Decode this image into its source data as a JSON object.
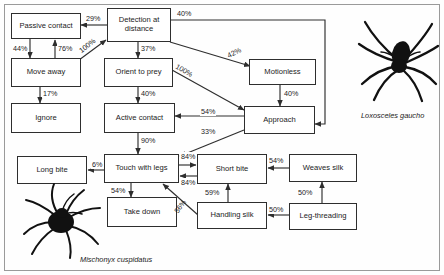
{
  "diagram": {
    "nodes": [
      {
        "id": "passive_contact",
        "label": "Passive contact"
      },
      {
        "id": "detection",
        "label": "Detection at distance"
      },
      {
        "id": "motionless",
        "label": "Motionless"
      },
      {
        "id": "move_away",
        "label": "Move away"
      },
      {
        "id": "orient",
        "label": "Orient to prey"
      },
      {
        "id": "approach",
        "label": "Approach"
      },
      {
        "id": "ignore",
        "label": "Ignore"
      },
      {
        "id": "active_contact",
        "label": "Active contact"
      },
      {
        "id": "long_bite",
        "label": "Long bite"
      },
      {
        "id": "touch_legs",
        "label": "Touch with legs"
      },
      {
        "id": "short_bite",
        "label": "Short bite"
      },
      {
        "id": "weaves_silk",
        "label": "Weaves silk"
      },
      {
        "id": "take_down",
        "label": "Take down"
      },
      {
        "id": "handling_silk",
        "label": "Handling silk"
      },
      {
        "id": "leg_threading",
        "label": "Leg-threading"
      }
    ],
    "edges": [
      {
        "from": "detection",
        "to": "passive_contact",
        "label": "29%"
      },
      {
        "from": "detection",
        "to": "approach",
        "label": "40%"
      },
      {
        "from": "detection",
        "to": "orient",
        "label": "37%"
      },
      {
        "from": "detection",
        "to": "motionless",
        "label": "42%"
      },
      {
        "from": "passive_contact",
        "to": "move_away",
        "label": "44%"
      },
      {
        "from": "move_away",
        "to": "passive_contact",
        "label": "76%"
      },
      {
        "from": "move_away",
        "to": "detection",
        "label": "100%"
      },
      {
        "from": "move_away",
        "to": "ignore",
        "label": "17%"
      },
      {
        "from": "orient",
        "to": "active_contact",
        "label": "40%"
      },
      {
        "from": "orient",
        "to": "approach",
        "label": "100%"
      },
      {
        "from": "motionless",
        "to": "approach",
        "label": "40%"
      },
      {
        "from": "approach",
        "to": "active_contact",
        "label": "54%"
      },
      {
        "from": "approach",
        "to": "touch_legs",
        "label": "33%"
      },
      {
        "from": "active_contact",
        "to": "touch_legs",
        "label": "90%"
      },
      {
        "from": "touch_legs",
        "to": "long_bite",
        "label": "6%"
      },
      {
        "from": "touch_legs",
        "to": "short_bite",
        "label": "84%"
      },
      {
        "from": "short_bite",
        "to": "touch_legs",
        "label": "84%"
      },
      {
        "from": "touch_legs",
        "to": "take_down",
        "label": "54%"
      },
      {
        "from": "handling_silk",
        "to": "touch_legs",
        "label": "56%"
      },
      {
        "from": "handling_silk",
        "to": "short_bite",
        "label": "59%"
      },
      {
        "from": "weaves_silk",
        "to": "short_bite",
        "label": "54%"
      },
      {
        "from": "leg_threading",
        "to": "weaves_silk",
        "label": "50%"
      },
      {
        "from": "leg_threading",
        "to": "handling_silk",
        "label": "50%"
      }
    ],
    "labels": {
      "p29": "29%",
      "p40_top": "40%",
      "p37": "37%",
      "p42": "42%",
      "p44": "44%",
      "p76": "76%",
      "p100_left": "100%",
      "p17": "17%",
      "p40_orient": "40%",
      "p100_right": "100%",
      "p40_motion": "40%",
      "p54_approach": "54%",
      "p33": "33%",
      "p90": "90%",
      "p6": "6%",
      "p84_top": "84%",
      "p84_bottom": "84%",
      "p54_take": "54%",
      "p56": "56%",
      "p59": "59%",
      "p54_weaves": "54%",
      "p50_weaves": "50%",
      "p50_handling": "50%"
    },
    "captions": {
      "species_right": "Loxosceles gaucho",
      "species_left": "Mischonyx cuspidatus"
    }
  }
}
